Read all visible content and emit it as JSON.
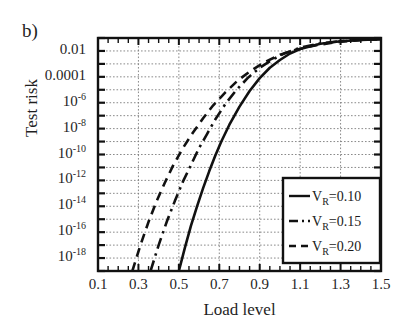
{
  "figure": {
    "panel_label": "b)",
    "background": "#ffffff",
    "ink_color": "#1a1a1a",
    "grid_color": "#8a8a8a"
  },
  "chart_data": {
    "type": "line",
    "title": "",
    "panel": "b)",
    "xlabel": "Load level",
    "ylabel": "Test risk",
    "xlim": [
      0.1,
      1.5
    ],
    "ylim_log10": [
      -19,
      -1
    ],
    "yscale": "log",
    "grid": true,
    "xticks": [
      0.1,
      0.3,
      0.5,
      0.7,
      0.9,
      1.1,
      1.3,
      1.5
    ],
    "xticklabels": [
      "0.1",
      "0.3",
      "0.5",
      "0.7",
      "0.9",
      "1.1",
      "1.3",
      "1.5"
    ],
    "xminor_step": 0.05,
    "yticks_log10": [
      -2,
      -4,
      -6,
      -8,
      -10,
      -12,
      -14,
      -16,
      -18
    ],
    "yticklabels": [
      "0.01",
      "0.0001",
      "10-6",
      "10-8",
      "10-10",
      "10-12",
      "10-14",
      "10-16",
      "10-18"
    ],
    "ytick_display": [
      {
        "mantissa": "0.01",
        "exp": ""
      },
      {
        "mantissa": "0.0001",
        "exp": ""
      },
      {
        "mantissa": "10",
        "exp": "-6"
      },
      {
        "mantissa": "10",
        "exp": "-8"
      },
      {
        "mantissa": "10",
        "exp": "-10"
      },
      {
        "mantissa": "10",
        "exp": "-12"
      },
      {
        "mantissa": "10",
        "exp": "-14"
      },
      {
        "mantissa": "10",
        "exp": "-16"
      },
      {
        "mantissa": "10",
        "exp": "-18"
      }
    ],
    "legend_position": "lower right",
    "series": [
      {
        "name": "V_R=0.10",
        "label_main": "V",
        "label_sub": "R",
        "label_rest": "=0.10",
        "linestyle": "solid",
        "color": "#111111",
        "x": [
          0.5,
          0.53,
          0.56,
          0.59,
          0.62,
          0.65,
          0.68,
          0.71,
          0.75,
          0.8,
          0.85,
          0.9,
          0.95,
          1.0,
          1.05,
          1.1,
          1.2,
          1.3,
          1.4,
          1.5
        ],
        "y_log10": [
          -19.0,
          -17.2,
          -15.5,
          -14.0,
          -12.6,
          -11.3,
          -10.1,
          -9.0,
          -7.7,
          -6.3,
          -5.1,
          -4.1,
          -3.3,
          -2.7,
          -2.2,
          -1.85,
          -1.45,
          -1.25,
          -1.15,
          -1.1
        ]
      },
      {
        "name": "V_R=0.15",
        "label_main": "V",
        "label_sub": "R",
        "label_rest": "=0.15",
        "linestyle": "dashdot",
        "color": "#111111",
        "x": [
          0.36,
          0.4,
          0.44,
          0.48,
          0.52,
          0.56,
          0.6,
          0.64,
          0.68,
          0.73,
          0.78,
          0.84,
          0.9,
          0.96,
          1.02,
          1.1,
          1.2,
          1.3,
          1.4,
          1.5
        ],
        "y_log10": [
          -19.0,
          -17.0,
          -15.2,
          -13.6,
          -12.1,
          -10.8,
          -9.5,
          -8.4,
          -7.3,
          -6.1,
          -5.1,
          -4.1,
          -3.3,
          -2.7,
          -2.2,
          -1.75,
          -1.42,
          -1.24,
          -1.14,
          -1.09
        ]
      },
      {
        "name": "V_R=0.20",
        "label_main": "V",
        "label_sub": "R",
        "label_rest": "=0.20",
        "linestyle": "dashed",
        "color": "#111111",
        "x": [
          0.27,
          0.31,
          0.35,
          0.39,
          0.43,
          0.47,
          0.52,
          0.57,
          0.62,
          0.67,
          0.73,
          0.79,
          0.85,
          0.92,
          1.0,
          1.08,
          1.18,
          1.3,
          1.4,
          1.5
        ],
        "y_log10": [
          -19.0,
          -17.0,
          -15.2,
          -13.6,
          -12.2,
          -10.9,
          -9.5,
          -8.3,
          -7.2,
          -6.2,
          -5.2,
          -4.3,
          -3.6,
          -2.9,
          -2.3,
          -1.9,
          -1.55,
          -1.28,
          -1.16,
          -1.1
        ]
      }
    ]
  },
  "legend": {
    "entries": [
      {
        "label_main": "V",
        "label_sub": "R",
        "label_rest": "=0.10",
        "style": "solid"
      },
      {
        "label_main": "V",
        "label_sub": "R",
        "label_rest": "=0.15",
        "style": "dashdot"
      },
      {
        "label_main": "V",
        "label_sub": "R",
        "label_rest": "=0.20",
        "style": "dashed"
      }
    ]
  }
}
